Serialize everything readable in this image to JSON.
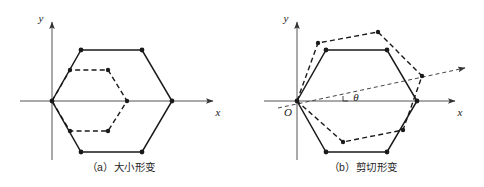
{
  "figure": {
    "background_color": "#ffffff",
    "line_color": "#1a1a1a",
    "axis_color": "#555555"
  },
  "panels": [
    {
      "id": "a",
      "caption": "（a）大小形变",
      "axes": {
        "x_label": "x",
        "y_label": "y",
        "origin_label": ""
      },
      "shapes": {
        "original_hexagon": {
          "style": "solid",
          "points": "52,101 81,50 142,50 172,101 142,152 81,152"
        },
        "deformed_hexagon": {
          "style": "dashed",
          "points": "52,101 70,70 108,70 127,101 108,131 70,131"
        }
      },
      "vertex_dots_solid": [
        [
          81,
          50
        ],
        [
          142,
          50
        ],
        [
          172,
          101
        ],
        [
          142,
          152
        ],
        [
          81,
          152
        ],
        [
          52,
          101
        ]
      ],
      "vertex_dots_dashed": [
        [
          70,
          70
        ],
        [
          108,
          70
        ],
        [
          127,
          101
        ],
        [
          108,
          131
        ],
        [
          70,
          131
        ]
      ]
    },
    {
      "id": "b",
      "caption": "（b）剪切形变",
      "axes": {
        "x_label": "x",
        "y_label": "y",
        "origin_label": "O"
      },
      "angle": {
        "symbol": "θ",
        "tick": true
      },
      "shapes": {
        "original_hexagon": {
          "style": "solid",
          "points": "55,101 84,50 145,50 175,101 145,152 84,152"
        },
        "deformed_hexagon": {
          "style": "dashed",
          "points": "55,101 76,43 136,32 180,76 161,130 101,142"
        },
        "shear_axis": {
          "style": "dashed",
          "from": [
            36,
            108
          ],
          "to": [
            223,
            68
          ]
        }
      },
      "vertex_dots_solid": [
        [
          84,
          50
        ],
        [
          145,
          50
        ],
        [
          175,
          101
        ],
        [
          145,
          152
        ],
        [
          84,
          152
        ],
        [
          55,
          101
        ]
      ],
      "vertex_dots_dashed": [
        [
          76,
          43
        ],
        [
          136,
          32
        ],
        [
          180,
          76
        ],
        [
          161,
          130
        ],
        [
          101,
          142
        ]
      ]
    }
  ]
}
